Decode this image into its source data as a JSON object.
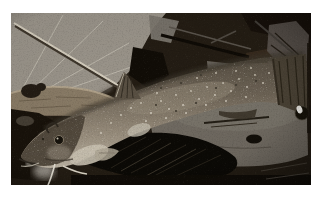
{
  "photo": {
    "alt": "Photograph of a catfish with pale whisker barbels lying diagonally across forest-floor litter, head at lower left and tail at upper right; a large pale dried leaf with a straight twig sits behind it, a rough log under its head, dark decayed leaves and twigs above, and pine needles and a broad gray-brown leaf beneath its body",
    "subject": "catfish on leaf litter",
    "orientation": "head lower-left, tail upper-right"
  },
  "scene": {
    "elements": [
      {
        "name": "dried-leaf",
        "desc": "pale dried leaf with radiating veins, top left"
      },
      {
        "name": "leaf-stem",
        "desc": "straight light twig crossing the dried leaf diagonally"
      },
      {
        "name": "dark-litter",
        "desc": "dark decayed leaves and twigs, top right"
      },
      {
        "name": "log",
        "desc": "rough tan log behind the fish head"
      },
      {
        "name": "catfish",
        "desc": "speckled catfish with raised dorsal fin, dark tail fin, eye with curled barbel and pale chin barbels"
      },
      {
        "name": "pine-needles",
        "desc": "near-black pine-needle cluster under the fish belly"
      },
      {
        "name": "ground-leaf",
        "desc": "broad gray-brown leaf with a small dark hole under the tail"
      },
      {
        "name": "shiny-berry",
        "desc": "small dark glossy sphere with white highlight at right edge"
      }
    ]
  },
  "palette": {
    "frame": "#ffffff",
    "background_dark": "#241d14",
    "dried_leaf": "#9a948a",
    "leaf_vein": "#bfbaae",
    "stem_light": "#d6cfbf",
    "log": "#897b66",
    "log_highlight": "#b7a88e",
    "fish_back": "#564e42",
    "fish_flank": "#8e8475",
    "fish_belly": "#ccc4b4",
    "fin_dark": "#4a4235",
    "barbel_light": "#e8e3d7",
    "pine_needles": "#0c0a06",
    "ground_leaf": "#716b62",
    "litter_dark": "#19130b"
  }
}
